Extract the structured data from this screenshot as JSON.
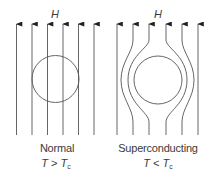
{
  "panels": [
    {
      "id": "normal",
      "field_label": "H",
      "state_label": "Normal",
      "condition": {
        "left": "T",
        "op": " > ",
        "right": "T",
        "right_sub": "c"
      },
      "field_lines": "straight, pass through sample",
      "line_count": 6
    },
    {
      "id": "superconducting",
      "field_label": "H",
      "state_label": "Superconducting",
      "condition": {
        "left": "T",
        "op": " < ",
        "right": "T",
        "right_sub": "c"
      },
      "field_lines": "expelled, bend around sample (Meissner effect)",
      "line_count": 6
    }
  ],
  "colors": {
    "line": "#555555",
    "text": "#3a3a3a",
    "background": "#ffffff"
  }
}
